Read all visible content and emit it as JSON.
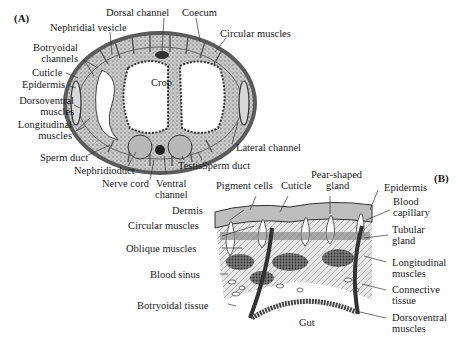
{
  "figure": {
    "panel_a": {
      "tag": "(A)",
      "labels": {
        "dorsal_channel": "Dorsal channel",
        "coecum": "Coecum",
        "nephridial_vesicle": "Nephridial vesicle",
        "circular_muscles": "Circular muscles",
        "botryoidal_channels_1": "Botryoidal",
        "botryoidal_channels_2": "channels",
        "cuticle": "Cuticle",
        "epidermis": "Epidermis",
        "crop": "Crop",
        "dorsoventral_1": "Dorsoventral",
        "dorsoventral_2": "muscles",
        "longitudinal_1": "Longitudinal",
        "longitudinal_2": "muscles",
        "lateral_channel": "Lateral channel",
        "sperm_duct_left": "Sperm duct",
        "nephridioduct": "Nephridioduct",
        "testis": "Testis",
        "sperm_duct_right": "Sperm duct",
        "nerve_cord": "Nerve cord",
        "ventral_channel_1": "Ventral",
        "ventral_channel_2": "channel"
      }
    },
    "panel_b": {
      "tag": "(B)",
      "labels": {
        "pigment_cells": "Pigment cells",
        "cuticle": "Cuticle",
        "pear_shaped_1": "Pear-shaped",
        "pear_shaped_2": "gland",
        "epidermis": "Epidermis",
        "dermis": "Dermis",
        "blood_capillary_1": "Blood",
        "blood_capillary_2": "capillary",
        "circular_muscles": "Circular muscles",
        "tubular_gland_1": "Tubular",
        "tubular_gland_2": "gland",
        "oblique_muscles": "Oblique muscles",
        "longitudinal_1": "Longitudinal",
        "longitudinal_2": "muscles",
        "blood_sinus": "Blood sinus",
        "connective_1": "Connective",
        "connective_2": "tissue",
        "botryoidal_tissue": "Botryoidal tissue",
        "dorsoventral_1": "Dorsoventral",
        "dorsoventral_2": "muscles",
        "gut": "Gut"
      }
    }
  }
}
